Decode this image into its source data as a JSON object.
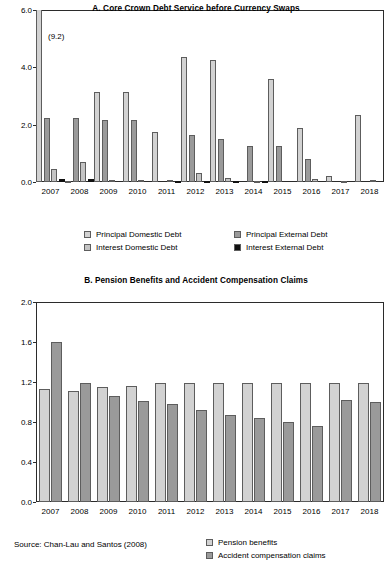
{
  "figure": {
    "source_note": "Source: Chan-Lau and Santos (2008)"
  },
  "chart_data": [
    {
      "id": "panel-a",
      "type": "bar",
      "title": "A. Core Crown Debt Service before Currency Swaps",
      "xlabel": "",
      "ylabel": "",
      "ylim": [
        0.0,
        6.0
      ],
      "yticks": [
        "0.0",
        "2.0",
        "4.0",
        "6.0"
      ],
      "ytick_values": [
        0.0,
        2.0,
        4.0,
        6.0
      ],
      "grid": false,
      "legend_position": "below",
      "categories": [
        "2007",
        "2008",
        "2009",
        "2010",
        "2011",
        "2012",
        "2013",
        "2014",
        "2015",
        "2016",
        "2017",
        "2018"
      ],
      "annotations": [
        {
          "text": "(9.2)",
          "category": "2007",
          "series": "Principal Domestic Debt",
          "note": "bar clipped at axis maximum"
        }
      ],
      "series": [
        {
          "name": "Principal Domestic Debt",
          "color": "#d2d2d2",
          "values": [
            9.2,
            0.05,
            3.15,
            3.15,
            1.75,
            4.35,
            4.25,
            0.0,
            3.6,
            1.9,
            0.2,
            2.35
          ]
        },
        {
          "name": "Principal External Debt",
          "color": "#9a9a9a",
          "values": [
            2.25,
            2.25,
            2.15,
            2.15,
            0.0,
            1.65,
            1.5,
            1.25,
            1.25,
            0.8,
            0.0,
            0.0
          ]
        },
        {
          "name": "Interest Domestic Debt",
          "color": "#c4c4c4",
          "values": [
            0.45,
            0.7,
            0.07,
            0.06,
            0.07,
            0.3,
            0.15,
            0.04,
            0.0,
            0.12,
            0.05,
            0.08
          ]
        },
        {
          "name": "Interest External Debt",
          "color": "#111111",
          "values": [
            0.12,
            0.12,
            0.0,
            0.0,
            0.05,
            0.05,
            0.04,
            0.03,
            0.0,
            0.0,
            0.0,
            0.0
          ]
        }
      ]
    },
    {
      "id": "panel-b",
      "type": "bar",
      "title": "B. Pension Benefits and Accident Compensation Claims",
      "xlabel": "",
      "ylabel": "",
      "ylim": [
        0.0,
        2.0
      ],
      "yticks": [
        "0.0",
        "0.4",
        "0.8",
        "1.2",
        "1.6",
        "2.0"
      ],
      "ytick_values": [
        0.0,
        0.4,
        0.8,
        1.2,
        1.6,
        2.0
      ],
      "grid": false,
      "legend_position": "below-right",
      "categories": [
        "2007",
        "2008",
        "2009",
        "2010",
        "2011",
        "2012",
        "2013",
        "2014",
        "2015",
        "2016",
        "2017",
        "2018"
      ],
      "series": [
        {
          "name": "Pension benefits",
          "color": "#d2d2d2",
          "values": [
            1.13,
            1.11,
            1.15,
            1.16,
            1.19,
            1.19,
            1.19,
            1.19,
            1.19,
            1.19,
            1.19,
            1.19
          ]
        },
        {
          "name": "Accident compensation claims",
          "color": "#9a9a9a",
          "values": [
            1.6,
            1.19,
            1.06,
            1.01,
            0.98,
            0.92,
            0.87,
            0.84,
            0.8,
            0.76,
            1.02,
            1.0
          ]
        }
      ]
    }
  ]
}
